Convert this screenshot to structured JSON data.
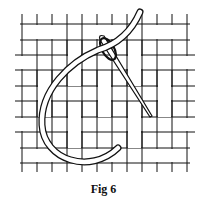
{
  "figure": {
    "caption": "Fig 6",
    "colors": {
      "line": "#111111",
      "background": "#ffffff"
    }
  }
}
